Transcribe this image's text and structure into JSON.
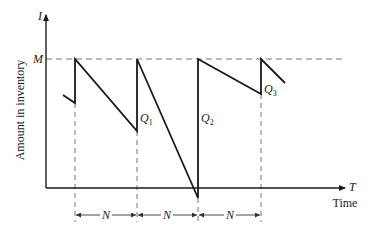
{
  "diagram": {
    "type": "inventory-sawtooth",
    "y_axis": {
      "symbol": "I",
      "label": "Amount in inventory"
    },
    "x_axis": {
      "symbol": "T",
      "label": "Time"
    },
    "max_level_label": "M",
    "order_labels": [
      {
        "name": "Q",
        "sub": "1"
      },
      {
        "name": "Q",
        "sub": "2"
      },
      {
        "name": "Q",
        "sub": "3"
      }
    ],
    "interval_labels": [
      "N",
      "N",
      "N"
    ],
    "line_color": "#1a1a1a",
    "dash_color": "#777777"
  }
}
